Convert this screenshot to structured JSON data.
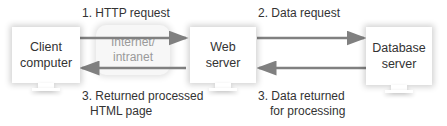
{
  "nodes": {
    "client": {
      "line1": "Client",
      "line2": "computer"
    },
    "network": {
      "line1": "Internet/",
      "line2": "intranet"
    },
    "web": {
      "line1": "Web",
      "line2": "server"
    },
    "database": {
      "line1": "Database",
      "line2": "server"
    }
  },
  "steps": {
    "http_request": "1. HTTP request",
    "data_request": "2. Data request",
    "returned_page_line1": "3. Returned processed",
    "returned_page_line2": "HTML page",
    "data_returned_line1": "3. Data returned",
    "data_returned_line2": "for processing"
  },
  "colors": {
    "arrow": "#808080",
    "network_text": "#9a9a9a",
    "text": "#333333"
  }
}
